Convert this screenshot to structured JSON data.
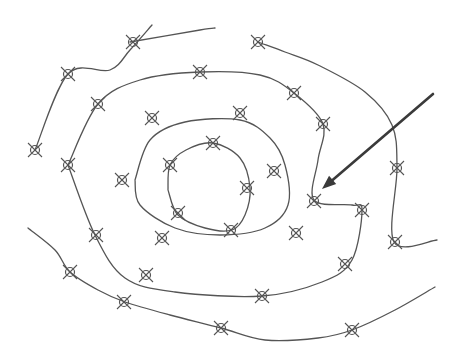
{
  "diagram": {
    "type": "contour-map",
    "colors": {
      "line": "#555555",
      "arrow": "#3a3a3a",
      "background": "#ffffff"
    },
    "marker_icon": "circle-with-x-icon",
    "contours": [
      {
        "id": "outermost-top",
        "points": [
          [
            152,
            25
          ],
          [
            130,
            50
          ],
          [
            110,
            70
          ],
          [
            68,
            74
          ],
          [
            35,
            150
          ]
        ]
      },
      {
        "id": "outer-top",
        "points": [
          [
            130,
            42
          ],
          [
            200,
            30
          ],
          [
            215,
            28
          ]
        ]
      },
      {
        "id": "ring-3-top",
        "points": [
          [
            258,
            42
          ],
          [
            285,
            52
          ],
          [
            318,
            65
          ],
          [
            365,
            92
          ],
          [
            392,
            125
          ],
          [
            397,
            168
          ],
          [
            394,
            242
          ],
          [
            437,
            240
          ]
        ]
      },
      {
        "id": "ring-2",
        "points": [
          [
            68,
            165
          ],
          [
            98,
            104
          ],
          [
            140,
            80
          ],
          [
            200,
            72
          ],
          [
            260,
            75
          ],
          [
            294,
            93
          ],
          [
            323,
            124
          ],
          [
            318,
            160
          ],
          [
            314,
            200
          ],
          [
            352,
            205
          ],
          [
            362,
            210
          ],
          [
            352,
            260
          ],
          [
            322,
            282
          ],
          [
            262,
            296
          ],
          [
            175,
            292
          ],
          [
            125,
            278
          ],
          [
            95,
            235
          ],
          [
            68,
            165
          ]
        ]
      },
      {
        "id": "ring-1",
        "points": [
          [
            135,
            180
          ],
          [
            150,
            140
          ],
          [
            185,
            122
          ],
          [
            240,
            120
          ],
          [
            270,
            138
          ],
          [
            285,
            165
          ],
          [
            288,
            205
          ],
          [
            265,
            228
          ],
          [
            220,
            235
          ],
          [
            175,
            228
          ],
          [
            140,
            205
          ],
          [
            135,
            180
          ]
        ]
      },
      {
        "id": "innermost",
        "points": [
          [
            168,
            190
          ],
          [
            170,
            165
          ],
          [
            186,
            150
          ],
          [
            213,
            143
          ],
          [
            240,
            158
          ],
          [
            250,
            188
          ],
          [
            245,
            215
          ],
          [
            232,
            230
          ],
          [
            205,
            228
          ],
          [
            178,
            215
          ],
          [
            168,
            190
          ]
        ]
      },
      {
        "id": "outer-bottom",
        "points": [
          [
            28,
            228
          ],
          [
            55,
            250
          ],
          [
            70,
            272
          ],
          [
            98,
            290
          ],
          [
            125,
            302
          ],
          [
            170,
            315
          ],
          [
            221,
            328
          ],
          [
            265,
            340
          ],
          [
            318,
            338
          ],
          [
            352,
            330
          ],
          [
            395,
            310
          ],
          [
            435,
            287
          ]
        ]
      }
    ],
    "markers": [
      [
        133,
        42
      ],
      [
        258,
        42
      ],
      [
        68,
        74
      ],
      [
        200,
        72
      ],
      [
        35,
        150
      ],
      [
        98,
        104
      ],
      [
        152,
        118
      ],
      [
        294,
        93
      ],
      [
        240,
        113
      ],
      [
        323,
        124
      ],
      [
        68,
        165
      ],
      [
        122,
        180
      ],
      [
        170,
        165
      ],
      [
        213,
        143
      ],
      [
        247,
        188
      ],
      [
        274,
        171
      ],
      [
        397,
        168
      ],
      [
        314,
        201
      ],
      [
        362,
        210
      ],
      [
        178,
        213
      ],
      [
        231,
        230
      ],
      [
        96,
        235
      ],
      [
        162,
        238
      ],
      [
        296,
        233
      ],
      [
        395,
        242
      ],
      [
        345,
        264
      ],
      [
        70,
        272
      ],
      [
        146,
        275
      ],
      [
        262,
        296
      ],
      [
        124,
        302
      ],
      [
        221,
        328
      ],
      [
        352,
        330
      ]
    ],
    "arrow": {
      "from": [
        433,
        94
      ],
      "to": [
        322,
        189
      ],
      "label": ""
    }
  }
}
